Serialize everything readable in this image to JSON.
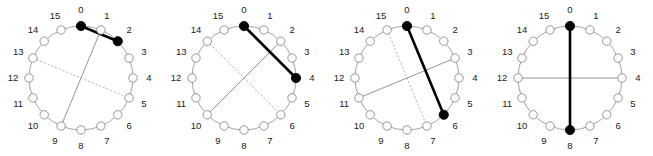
{
  "figure": {
    "title": "",
    "node_count": 16,
    "node_labels": [
      "0",
      "1",
      "2",
      "3",
      "4",
      "5",
      "6",
      "7",
      "8",
      "9",
      "10",
      "11",
      "12",
      "13",
      "14",
      "15"
    ],
    "colors": {
      "background": "#ffffff",
      "circle_outline": "#9a9a9a",
      "node_outline": "#8a8a8a",
      "node_fill_empty": "#ffffff",
      "node_fill_marked": "#000000",
      "chord_thick": "#000000",
      "chord_thin": "#888888",
      "chord_dotted": "#b0b0b0",
      "label_text": "#1a1a1a"
    },
    "geometry": {
      "panel_width": 163,
      "panel_height": 156,
      "center_x": 81,
      "center_y": 78,
      "ring_radius": 52,
      "label_radius": 68,
      "node_radius": 4.2,
      "marked_node_radius": 4.6
    },
    "line_styles": {
      "thick": {
        "width": 2.6,
        "dash": "none"
      },
      "thin": {
        "width": 0.9,
        "dash": "none"
      },
      "dotted": {
        "width": 0.9,
        "dash": "1.5 2.5"
      }
    }
  },
  "panels": [
    {
      "id": "panel-1",
      "name": "rotation-step-1",
      "marked_nodes": [
        0,
        2
      ],
      "chords": [
        {
          "name": "primary-chord",
          "style": "thick",
          "from": 0,
          "to": 2
        },
        {
          "name": "secondary-chord",
          "style": "thin",
          "from": 1,
          "to": 9
        },
        {
          "name": "tertiary-chord",
          "style": "dotted",
          "from": 13,
          "to": 5
        }
      ]
    },
    {
      "id": "panel-2",
      "name": "rotation-step-2",
      "marked_nodes": [
        0,
        4
      ],
      "chords": [
        {
          "name": "primary-chord",
          "style": "thick",
          "from": 0,
          "to": 4
        },
        {
          "name": "secondary-chord",
          "style": "thin",
          "from": 2,
          "to": 10
        },
        {
          "name": "tertiary-chord",
          "style": "dotted",
          "from": 14,
          "to": 6
        }
      ]
    },
    {
      "id": "panel-3",
      "name": "rotation-step-3",
      "marked_nodes": [
        0,
        6
      ],
      "chords": [
        {
          "name": "primary-chord",
          "style": "thick",
          "from": 0,
          "to": 6
        },
        {
          "name": "secondary-chord",
          "style": "thin",
          "from": 3,
          "to": 11
        },
        {
          "name": "tertiary-chord",
          "style": "dotted",
          "from": 15,
          "to": 7
        }
      ]
    },
    {
      "id": "panel-4",
      "name": "rotation-step-4",
      "marked_nodes": [
        0,
        8
      ],
      "chords": [
        {
          "name": "primary-chord",
          "style": "thick",
          "from": 0,
          "to": 8
        },
        {
          "name": "secondary-chord",
          "style": "thin",
          "from": 4,
          "to": 12
        },
        {
          "name": "tertiary-chord",
          "style": "dotted",
          "from": 0,
          "to": 8
        }
      ]
    }
  ]
}
